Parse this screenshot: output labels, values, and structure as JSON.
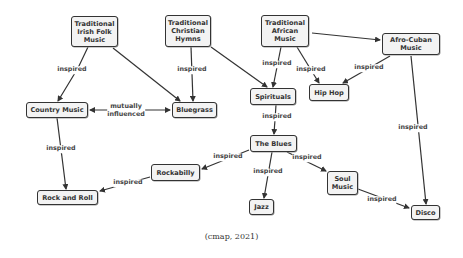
{
  "nodes": [
    {
      "id": "irish",
      "label": "Traditional\nIrish Folk\nMusic",
      "x": 71,
      "y": 16,
      "w": 47,
      "h": 31
    },
    {
      "id": "hymns",
      "label": "Traditional\nChristian\nHymns",
      "x": 165,
      "y": 15,
      "w": 46,
      "h": 32
    },
    {
      "id": "african",
      "label": "Traditional\nAfrican\nMusic",
      "x": 261,
      "y": 15,
      "w": 48,
      "h": 32
    },
    {
      "id": "afrocuban",
      "label": "Afro-Cuban\nMusic",
      "x": 382,
      "y": 33,
      "w": 58,
      "h": 22
    },
    {
      "id": "country",
      "label": "Country Music",
      "x": 26,
      "y": 102,
      "w": 62,
      "h": 16
    },
    {
      "id": "bluegrass",
      "label": "Bluegrass",
      "x": 172,
      "y": 102,
      "w": 45,
      "h": 16
    },
    {
      "id": "spirituals",
      "label": "Spirituals",
      "x": 250,
      "y": 88,
      "w": 46,
      "h": 17
    },
    {
      "id": "hiphop",
      "label": "Hip Hop",
      "x": 309,
      "y": 84,
      "w": 40,
      "h": 17
    },
    {
      "id": "blues",
      "label": "The Blues",
      "x": 250,
      "y": 135,
      "w": 47,
      "h": 17
    },
    {
      "id": "rockabilly",
      "label": "Rockabilly",
      "x": 151,
      "y": 164,
      "w": 49,
      "h": 17
    },
    {
      "id": "rockandroll",
      "label": "Rock and Roll",
      "x": 37,
      "y": 190,
      "w": 61,
      "h": 15
    },
    {
      "id": "soul",
      "label": "Soul\nMusic",
      "x": 327,
      "y": 171,
      "w": 31,
      "h": 24
    },
    {
      "id": "jazz",
      "label": "Jazz",
      "x": 249,
      "y": 199,
      "w": 25,
      "h": 16
    },
    {
      "id": "disco",
      "label": "Disco",
      "x": 411,
      "y": 205,
      "w": 29,
      "h": 15
    }
  ],
  "links": [
    {
      "from": "irish",
      "to": "country",
      "label": "inspired",
      "path": [
        [
          88,
          47
        ],
        [
          78,
          68
        ],
        [
          58,
          101
        ]
      ],
      "label_pos": [
        72,
        70
      ]
    },
    {
      "from": "irish",
      "to": "bluegrass",
      "label": "",
      "path": [
        [
          113,
          48
        ],
        [
          180,
          101
        ]
      ],
      "label_pos": null
    },
    {
      "from": "hymns",
      "to": "bluegrass",
      "label": "inspired",
      "path": [
        [
          191,
          47
        ],
        [
          193,
          101
        ]
      ],
      "label_pos": [
        192,
        70
      ]
    },
    {
      "from": "hymns",
      "to": "spirituals",
      "label": "",
      "path": [
        [
          211,
          47
        ],
        [
          267,
          87
        ]
      ],
      "label_pos": null
    },
    {
      "from": "african",
      "to": "spirituals",
      "label": "inspired",
      "path": [
        [
          281,
          47
        ],
        [
          273,
          87
        ]
      ],
      "label_pos": [
        277,
        64
      ]
    },
    {
      "from": "african",
      "to": "hiphop",
      "label": "inspired",
      "path": [
        [
          297,
          47
        ],
        [
          319,
          83
        ]
      ],
      "label_pos": [
        311,
        70
      ]
    },
    {
      "from": "african",
      "to": "afrocuban",
      "label": "",
      "path": [
        [
          312,
          33
        ],
        [
          380,
          40
        ]
      ],
      "label_pos": null
    },
    {
      "from": "afrocuban",
      "to": "hiphop",
      "label": "inspired",
      "path": [
        [
          390,
          56
        ],
        [
          343,
          83
        ]
      ],
      "label_pos": [
        369,
        68
      ]
    },
    {
      "from": "afrocuban",
      "to": "disco",
      "label": "inspired",
      "path": [
        [
          411,
          56
        ],
        [
          426,
          204
        ]
      ],
      "label_pos": [
        413,
        128
      ]
    },
    {
      "from": "country",
      "to": "bluegrass",
      "label": "mutually\ninfluenced",
      "path": [
        [
          170,
          110
        ],
        [
          90,
          110
        ]
      ],
      "label_pos": [
        126,
        110
      ],
      "bidirectional": true
    },
    {
      "from": "country",
      "to": "rockandroll",
      "label": "inspired",
      "path": [
        [
          57,
          118
        ],
        [
          66,
          189
        ]
      ],
      "label_pos": [
        61,
        149
      ]
    },
    {
      "from": "spirituals",
      "to": "blues",
      "label": "inspired",
      "path": [
        [
          276,
          105
        ],
        [
          274,
          134
        ]
      ],
      "label_pos": [
        277,
        117
      ]
    },
    {
      "from": "blues",
      "to": "rockabilly",
      "label": "inspired",
      "path": [
        [
          249,
          150
        ],
        [
          202,
          169
        ]
      ],
      "label_pos": [
        228,
        157
      ]
    },
    {
      "from": "blues",
      "to": "jazz",
      "label": "inspired",
      "path": [
        [
          272,
          152
        ],
        [
          264,
          198
        ]
      ],
      "label_pos": [
        268,
        172
      ]
    },
    {
      "from": "blues",
      "to": "soul",
      "label": "inspired",
      "path": [
        [
          287,
          152
        ],
        [
          326,
          171
        ]
      ],
      "label_pos": [
        307,
        158
      ]
    },
    {
      "from": "rockabilly",
      "to": "rockandroll",
      "label": "inspired",
      "path": [
        [
          150,
          177
        ],
        [
          100,
          191
        ]
      ],
      "label_pos": [
        128,
        183
      ]
    },
    {
      "from": "soul",
      "to": "disco",
      "label": "inspired",
      "path": [
        [
          358,
          189
        ],
        [
          409,
          208
        ]
      ],
      "label_pos": [
        382,
        200
      ]
    }
  ],
  "caption": "(cmap, 2021)",
  "colors": {
    "node_border": "#333333",
    "node_fill": "#f3f3f3",
    "line": "#333333",
    "text": "#333333"
  }
}
